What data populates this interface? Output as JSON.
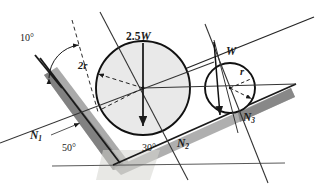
{
  "figure": {
    "colors": {
      "stroke": "#1a1a1a",
      "shadow": "#9c9c9c",
      "shadow_dark": "#6e6e6e",
      "big_circle_fill": "#e9e9e9",
      "small_circle_fill": "#ffffff",
      "ground_line": "#555555",
      "background": "#ffffff"
    },
    "angles": [
      {
        "id": "angle-10",
        "value": "10",
        "unit": "°",
        "label": "10°",
        "x": 20,
        "y": 38
      },
      {
        "id": "angle-50",
        "value": "50",
        "unit": "°",
        "label": "50°",
        "x": 62,
        "y": 148
      },
      {
        "id": "angle-30",
        "value": "30",
        "unit": "°",
        "label": "30°",
        "x": 142,
        "y": 148
      }
    ],
    "forces": [
      {
        "id": "force-n1",
        "symbol": "N",
        "subscript": "1",
        "label": "N₁",
        "x": 37,
        "y": 136
      },
      {
        "id": "force-n2",
        "symbol": "N",
        "subscript": "2",
        "label": "N₂",
        "x": 177,
        "y": 143
      },
      {
        "id": "force-n3",
        "symbol": "N",
        "subscript": "3",
        "label": "N₃",
        "x": 243,
        "y": 118
      }
    ],
    "weights": [
      {
        "id": "weight-large-cylinder",
        "label": "2.5W",
        "numeric": "2.5",
        "symbol": "W",
        "x": 127,
        "y": 36
      },
      {
        "id": "weight-small-cylinder",
        "label": "W",
        "numeric": "1",
        "symbol": "W",
        "x": 228,
        "y": 51
      }
    ],
    "radii": [
      {
        "id": "radius-large",
        "label": "2r",
        "value": "2r",
        "x": 79,
        "y": 66
      },
      {
        "id": "radius-small",
        "label": "r",
        "value": "r",
        "x": 240,
        "y": 72
      }
    ],
    "circles": [
      {
        "id": "large-cylinder",
        "cx": 143,
        "cy": 88,
        "r": 47,
        "fill": "#e9e9e9",
        "weight": "2.5W",
        "radius_label": "2r"
      },
      {
        "id": "small-cylinder",
        "cx": 230,
        "cy": 88,
        "r": 25,
        "fill": "#ffffff",
        "weight": "W",
        "radius_label": "r"
      }
    ],
    "surfaces": [
      {
        "id": "left-incline",
        "angle": "50",
        "normal": "N₁"
      },
      {
        "id": "right-incline",
        "angle": "30",
        "normal": "N₂"
      },
      {
        "id": "upper-right-plane",
        "angle": "10",
        "normal": "N₃"
      },
      {
        "id": "ground-line",
        "angle": "0",
        "normal": ""
      }
    ]
  }
}
